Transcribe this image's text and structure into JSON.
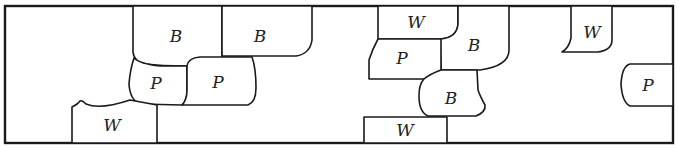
{
  "diagram": {
    "title": "",
    "legend_codes": [
      "B",
      "P",
      "W"
    ],
    "regions": [
      {
        "id": "r1",
        "label": "B"
      },
      {
        "id": "r2",
        "label": "B"
      },
      {
        "id": "r3",
        "label": "P"
      },
      {
        "id": "r4",
        "label": "P"
      },
      {
        "id": "r5",
        "label": "W"
      },
      {
        "id": "r6",
        "label": "W"
      },
      {
        "id": "r7",
        "label": "P"
      },
      {
        "id": "r8",
        "label": "B"
      },
      {
        "id": "r9",
        "label": "B"
      },
      {
        "id": "r10",
        "label": "W"
      },
      {
        "id": "r11",
        "label": "W"
      },
      {
        "id": "r12",
        "label": "P"
      }
    ]
  }
}
